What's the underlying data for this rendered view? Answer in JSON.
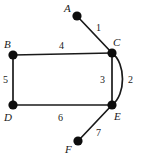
{
  "diagram": {
    "colors": {
      "stroke": "#1a1a1a",
      "vertex_fill": "#0d0d0d",
      "background": "#ffffff",
      "text": "#1a1a1a"
    },
    "vertices": [
      {
        "id": "A",
        "label": "A",
        "x": 77,
        "y": 16,
        "label_x": 64,
        "label_y": 12
      },
      {
        "id": "B",
        "label": "B",
        "x": 13,
        "y": 55,
        "label_x": 4,
        "label_y": 48
      },
      {
        "id": "C",
        "label": "C",
        "x": 112,
        "y": 53,
        "label_x": 113,
        "label_y": 46
      },
      {
        "id": "D",
        "label": "D",
        "x": 13,
        "y": 105,
        "label_x": 4,
        "label_y": 121
      },
      {
        "id": "E",
        "label": "E",
        "x": 112,
        "y": 105,
        "label_x": 114,
        "label_y": 120
      },
      {
        "id": "F",
        "label": "F",
        "x": 78,
        "y": 141,
        "label_x": 65,
        "label_y": 153
      }
    ],
    "edges": [
      {
        "id": "e1",
        "label": "1",
        "from": "A",
        "to": "C",
        "shape": "line",
        "label_x": 96,
        "label_y": 31
      },
      {
        "id": "e2",
        "label": "2",
        "from": "C",
        "to": "E",
        "shape": "arc",
        "label_x": 128,
        "label_y": 83
      },
      {
        "id": "e3",
        "label": "3",
        "from": "C",
        "to": "E",
        "shape": "line",
        "label_x": 100,
        "label_y": 83
      },
      {
        "id": "e4",
        "label": "4",
        "from": "B",
        "to": "C",
        "shape": "line",
        "label_x": 59,
        "label_y": 49
      },
      {
        "id": "e5",
        "label": "5",
        "from": "B",
        "to": "D",
        "shape": "line",
        "label_x": 3,
        "label_y": 83
      },
      {
        "id": "e6",
        "label": "6",
        "from": "D",
        "to": "E",
        "shape": "line",
        "label_x": 58,
        "label_y": 121
      },
      {
        "id": "e7",
        "label": "7",
        "from": "E",
        "to": "F",
        "shape": "line",
        "label_x": 96,
        "label_y": 136
      }
    ]
  }
}
